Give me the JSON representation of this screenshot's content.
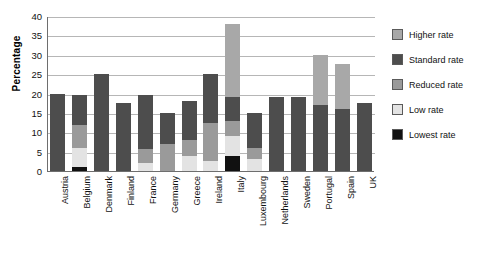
{
  "chart_data": {
    "type": "bar",
    "subtype": "stacked-vertical",
    "title": "",
    "xlabel": "",
    "ylabel": "Percentage",
    "ylim": [
      0,
      40
    ],
    "yticks": [
      0,
      5,
      10,
      15,
      20,
      25,
      30,
      35,
      40
    ],
    "grid": true,
    "legend_position": "right",
    "categories": [
      "Austria",
      "Belgium",
      "Denmark",
      "Finland",
      "France",
      "Germany",
      "Greece",
      "Ireland",
      "Italy",
      "Luxembourg",
      "Netherlands",
      "Sweden",
      "Portugal",
      "Spain",
      "UK"
    ],
    "series": [
      {
        "name": "Lowest rate",
        "color": "#111111",
        "values": [
          0,
          1,
          0,
          0,
          0,
          0,
          0,
          0,
          4,
          0,
          0,
          0,
          0,
          0,
          0
        ]
      },
      {
        "name": "Low rate",
        "color": "#e3e3e3",
        "values": [
          0,
          5,
          0,
          0,
          2.1,
          0,
          4,
          2.5,
          5,
          3,
          0,
          0,
          0,
          0,
          0
        ]
      },
      {
        "name": "Reduced rate",
        "color": "#9a9a9a",
        "values": [
          0,
          6,
          0,
          0,
          3.5,
          7,
          4,
          10,
          4,
          3,
          0,
          0,
          0,
          0,
          0
        ]
      },
      {
        "name": "Standard rate",
        "color": "#4d4d4d",
        "values": [
          20,
          7.5,
          25,
          17.5,
          13.9,
          8,
          10,
          12.5,
          6,
          9,
          19,
          19,
          17,
          16,
          17.5
        ]
      },
      {
        "name": "Higher rate",
        "color": "#a8a8a8",
        "values": [
          0,
          0,
          0,
          0,
          0,
          0,
          0,
          0,
          19,
          0,
          0,
          0,
          13,
          11.5,
          0
        ]
      }
    ],
    "totals": [
      20,
      19.5,
      25,
      17.5,
      19.5,
      15,
      18,
      25,
      38,
      15,
      19,
      19,
      30,
      27.5,
      17.5
    ],
    "stack_order_bottom_to_top": [
      "Lowest rate",
      "Low rate",
      "Reduced rate",
      "Standard rate",
      "Higher rate"
    ]
  },
  "legend": {
    "items": [
      {
        "label": "Higher rate",
        "color": "#a8a8a8"
      },
      {
        "label": "Standard rate",
        "color": "#4d4d4d"
      },
      {
        "label": "Reduced rate",
        "color": "#9a9a9a"
      },
      {
        "label": "Low rate",
        "color": "#e3e3e3"
      },
      {
        "label": "Lowest rate",
        "color": "#111111"
      }
    ]
  },
  "axis": {
    "y_title": "Percentage",
    "y_ticks": [
      "40",
      "35",
      "30",
      "25",
      "20",
      "15",
      "10",
      "5",
      "0"
    ]
  }
}
